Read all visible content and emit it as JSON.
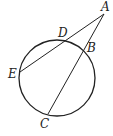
{
  "diagram": {
    "type": "circle with two secants from external point",
    "circle": {
      "cx": 57,
      "cy": 78,
      "r": 38,
      "stroke": "#222222"
    },
    "points": {
      "A": {
        "label": "A",
        "x": 104,
        "y": 14,
        "lx": 101,
        "ly": 11
      },
      "B": {
        "label": "B",
        "x": 83,
        "y": 51,
        "lx": 87,
        "ly": 52
      },
      "C": {
        "label": "C",
        "x": 48,
        "y": 114,
        "lx": 40,
        "ly": 128
      },
      "D": {
        "label": "D",
        "x": 66,
        "y": 41,
        "lx": 58,
        "ly": 37
      },
      "E": {
        "label": "E",
        "x": 20,
        "y": 72,
        "lx": 8,
        "ly": 78
      }
    },
    "segments": [
      {
        "from": "A",
        "to": "E"
      },
      {
        "from": "A",
        "to": "C"
      }
    ]
  }
}
